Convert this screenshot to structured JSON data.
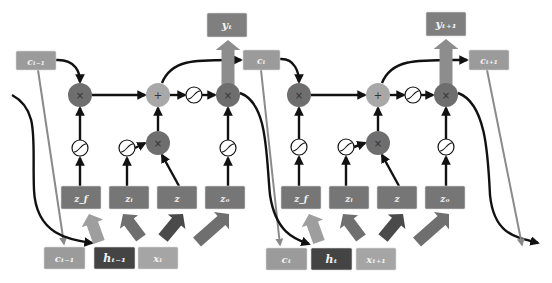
{
  "diagram": {
    "colors": {
      "background": "#ffffff",
      "state_box": "#9b9b9b",
      "output_box": "#7f7f7f",
      "hidden_box": "#444444",
      "input_box": "#a5a5a5",
      "gate_box": "#767676",
      "mul_node": "#6e6e6e",
      "add_node": "#a8a8a8",
      "sigmoid_fill": "#ffffff",
      "arrow_black": "#111111",
      "arrow_gray": "#8a8a8a",
      "fat_arrow_light": "#9e9e9e",
      "fat_arrow_mid": "#6f6f6f",
      "fat_arrow_dark": "#4a4a4a",
      "fat_arrow_output": "#8d8d8d"
    },
    "cells": [
      {
        "name": "cell-t",
        "boxes": {
          "c_prev_top": {
            "label": "cₜ₋₁",
            "x": 16,
            "y": 51,
            "w": 40,
            "h": 19
          },
          "y_out": {
            "label": "yₜ",
            "x": 207,
            "y": 13,
            "w": 40,
            "h": 24
          },
          "c_out": {
            "label": "cₜ",
            "x": 243,
            "y": 50,
            "w": 37,
            "h": 20
          },
          "z_f": {
            "label": "z_f",
            "x": 61,
            "y": 186,
            "w": 40,
            "h": 23
          },
          "z_i": {
            "label": "zᵢ",
            "x": 109,
            "y": 186,
            "w": 40,
            "h": 23
          },
          "z": {
            "label": "z",
            "x": 157,
            "y": 186,
            "w": 40,
            "h": 23
          },
          "z_o": {
            "label": "zₒ",
            "x": 205,
            "y": 186,
            "w": 40,
            "h": 23
          },
          "c_in": {
            "label": "cₜ₋₁",
            "x": 44,
            "y": 247,
            "w": 41,
            "h": 22
          },
          "h_in": {
            "label": "hₜ₋₁",
            "x": 94,
            "y": 247,
            "w": 41,
            "h": 22
          },
          "x_in": {
            "label": "xₜ",
            "x": 138,
            "y": 247,
            "w": 40,
            "h": 22
          }
        },
        "nodes": {
          "forget_mul": {
            "symbol": "×",
            "cx": 80,
            "cy": 95
          },
          "add": {
            "symbol": "+",
            "cx": 158,
            "cy": 95
          },
          "tanh": {
            "symbol": "sigmoid",
            "cx": 194,
            "cy": 95
          },
          "out_mul": {
            "symbol": "×",
            "cx": 228,
            "cy": 95
          },
          "sig_f": {
            "symbol": "sigmoid",
            "cx": 80,
            "cy": 148
          },
          "sig_i": {
            "symbol": "sigmoid",
            "cx": 127,
            "cy": 148
          },
          "in_mul": {
            "symbol": "×",
            "cx": 158,
            "cy": 143
          },
          "sig_o": {
            "symbol": "sigmoid",
            "cx": 228,
            "cy": 148
          }
        }
      },
      {
        "name": "cell-t-plus-1",
        "boxes": {
          "y_out": {
            "label": "yₜ₊₁",
            "x": 426,
            "y": 12,
            "w": 40,
            "h": 24
          },
          "c_out": {
            "label": "cₜ₊₁",
            "x": 469,
            "y": 50,
            "w": 40,
            "h": 20
          },
          "z_f": {
            "label": "z_f",
            "x": 281,
            "y": 186,
            "w": 40,
            "h": 23
          },
          "z_i": {
            "label": "zᵢ",
            "x": 329,
            "y": 186,
            "w": 40,
            "h": 23
          },
          "z": {
            "label": "z",
            "x": 377,
            "y": 186,
            "w": 40,
            "h": 23
          },
          "z_o": {
            "label": "zₒ",
            "x": 425,
            "y": 186,
            "w": 40,
            "h": 23
          },
          "c_in": {
            "label": "cₜ",
            "x": 266,
            "y": 248,
            "w": 41,
            "h": 22
          },
          "h_in": {
            "label": "hₜ",
            "x": 311,
            "y": 248,
            "w": 41,
            "h": 22
          },
          "x_in": {
            "label": "xₜ₊₁",
            "x": 356,
            "y": 248,
            "w": 40,
            "h": 22
          }
        },
        "nodes": {
          "forget_mul": {
            "symbol": "×",
            "cx": 299,
            "cy": 95
          },
          "add": {
            "symbol": "+",
            "cx": 378,
            "cy": 95
          },
          "tanh": {
            "symbol": "sigmoid",
            "cx": 413,
            "cy": 95
          },
          "out_mul": {
            "symbol": "×",
            "cx": 446,
            "cy": 95
          },
          "sig_f": {
            "symbol": "sigmoid",
            "cx": 299,
            "cy": 147
          },
          "sig_i": {
            "symbol": "sigmoid",
            "cx": 346,
            "cy": 147
          },
          "in_mul": {
            "symbol": "×",
            "cx": 378,
            "cy": 143
          },
          "sig_o": {
            "symbol": "sigmoid",
            "cx": 446,
            "cy": 147
          }
        }
      }
    ]
  }
}
